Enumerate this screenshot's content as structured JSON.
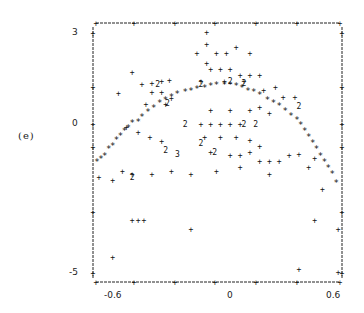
{
  "panel_label": "(e)",
  "axes": {
    "y_ticks": [
      "3",
      "0",
      "-5"
    ],
    "x_ticks": [
      "-0.6",
      "0",
      "0.6"
    ]
  },
  "chart_data": {
    "type": "scatter",
    "title": "",
    "panel": "(e)",
    "xlabel": "",
    "ylabel": "",
    "xlim": [
      -0.65,
      0.62
    ],
    "ylim": [
      -5.2,
      3.2
    ],
    "x_ticks": [
      -0.6,
      0,
      0.6
    ],
    "y_ticks": [
      -5,
      0,
      3
    ],
    "grid": false,
    "legend": null,
    "marker_note": "Line-printer style scatter: '+' single point, '*' dense/fitted points, '2'/'3' indicate overlapping point counts",
    "series": [
      {
        "name": "fitted-curve (*)",
        "marker": "*",
        "points": [
          [
            -0.63,
            -1.3
          ],
          [
            -0.61,
            -1.2
          ],
          [
            -0.59,
            -1.1
          ],
          [
            -0.57,
            -0.9
          ],
          [
            -0.55,
            -0.8
          ],
          [
            -0.53,
            -0.6
          ],
          [
            -0.51,
            -0.45
          ],
          [
            -0.49,
            -0.3
          ],
          [
            -0.47,
            -0.2
          ],
          [
            -0.45,
            -0.05
          ],
          [
            -0.42,
            0.0
          ],
          [
            -0.4,
            0.15
          ],
          [
            -0.37,
            0.3
          ],
          [
            -0.34,
            0.45
          ],
          [
            -0.31,
            0.6
          ],
          [
            -0.28,
            0.7
          ],
          [
            -0.25,
            0.8
          ],
          [
            -0.22,
            0.9
          ],
          [
            -0.18,
            0.95
          ],
          [
            -0.15,
            1.0
          ],
          [
            -0.12,
            1.05
          ],
          [
            -0.08,
            1.1
          ],
          [
            -0.05,
            1.15
          ],
          [
            -0.02,
            1.2
          ],
          [
            0.02,
            1.2
          ],
          [
            0.05,
            1.2
          ],
          [
            0.08,
            1.15
          ],
          [
            0.11,
            1.1
          ],
          [
            0.14,
            1.0
          ],
          [
            0.17,
            0.95
          ],
          [
            0.2,
            0.85
          ],
          [
            0.24,
            0.7
          ],
          [
            0.27,
            0.6
          ],
          [
            0.3,
            0.5
          ],
          [
            0.33,
            0.35
          ],
          [
            0.36,
            0.2
          ],
          [
            0.39,
            0.05
          ],
          [
            0.41,
            -0.1
          ],
          [
            0.43,
            -0.3
          ],
          [
            0.45,
            -0.5
          ],
          [
            0.47,
            -0.7
          ],
          [
            0.49,
            -0.9
          ],
          [
            0.51,
            -1.1
          ],
          [
            0.53,
            -1.3
          ],
          [
            0.55,
            -1.5
          ],
          [
            0.57,
            -1.7
          ],
          [
            0.59,
            -2.0
          ]
        ]
      },
      {
        "name": "observations (+)",
        "marker": "+",
        "points": [
          [
            -0.45,
            1.6
          ],
          [
            -0.52,
            0.9
          ],
          [
            -0.4,
            1.2
          ],
          [
            -0.35,
            1.25
          ],
          [
            -0.3,
            1.3
          ],
          [
            -0.26,
            1.35
          ],
          [
            -0.35,
            0.95
          ],
          [
            -0.3,
            0.95
          ],
          [
            -0.25,
            0.75
          ],
          [
            -0.38,
            0.55
          ],
          [
            -0.28,
            0.55
          ],
          [
            -0.48,
            -0.2
          ],
          [
            -0.42,
            -0.35
          ],
          [
            -0.36,
            -0.5
          ],
          [
            -0.3,
            -0.65
          ],
          [
            -0.5,
            -1.6
          ],
          [
            -0.45,
            -1.7
          ],
          [
            -0.35,
            -1.7
          ],
          [
            -0.25,
            -1.6
          ],
          [
            -0.15,
            -1.7
          ],
          [
            -0.55,
            -1.9
          ],
          [
            -0.62,
            -1.8
          ],
          [
            -0.45,
            -3.2
          ],
          [
            -0.42,
            -3.2
          ],
          [
            -0.39,
            -3.2
          ],
          [
            -0.55,
            -4.4
          ],
          [
            -0.15,
            -3.5
          ],
          [
            -0.07,
            2.9
          ],
          [
            -0.07,
            2.5
          ],
          [
            -0.12,
            2.2
          ],
          [
            -0.02,
            2.2
          ],
          [
            0.03,
            2.2
          ],
          [
            0.08,
            2.4
          ],
          [
            0.15,
            2.2
          ],
          [
            -0.07,
            1.9
          ],
          [
            -0.05,
            1.7
          ],
          [
            0.0,
            1.7
          ],
          [
            0.05,
            1.7
          ],
          [
            0.1,
            1.5
          ],
          [
            0.15,
            1.5
          ],
          [
            0.2,
            1.5
          ],
          [
            -0.1,
            1.3
          ],
          [
            0.02,
            1.3
          ],
          [
            0.12,
            1.3
          ],
          [
            0.22,
            1.0
          ],
          [
            0.28,
            1.1
          ],
          [
            0.32,
            0.8
          ],
          [
            0.38,
            0.8
          ],
          [
            -0.05,
            0.35
          ],
          [
            0.05,
            0.35
          ],
          [
            0.15,
            0.35
          ],
          [
            0.2,
            0.45
          ],
          [
            0.25,
            0.25
          ],
          [
            -0.1,
            -0.1
          ],
          [
            -0.05,
            -0.1
          ],
          [
            0.0,
            -0.1
          ],
          [
            0.05,
            -0.1
          ],
          [
            0.1,
            -0.1
          ],
          [
            -0.08,
            -0.5
          ],
          [
            0.0,
            -0.5
          ],
          [
            0.08,
            -0.5
          ],
          [
            0.15,
            -0.6
          ],
          [
            0.2,
            -0.8
          ],
          [
            -0.05,
            -1.0
          ],
          [
            0.05,
            -1.1
          ],
          [
            0.1,
            -1.1
          ],
          [
            0.15,
            -1.0
          ],
          [
            0.2,
            -1.3
          ],
          [
            0.25,
            -1.3
          ],
          [
            0.3,
            -1.3
          ],
          [
            0.35,
            -1.1
          ],
          [
            0.4,
            -1.05
          ],
          [
            -0.02,
            -1.6
          ],
          [
            0.1,
            -1.5
          ],
          [
            0.25,
            -1.7
          ],
          [
            0.45,
            -1.5
          ],
          [
            0.48,
            -1.2
          ],
          [
            0.52,
            -2.2
          ],
          [
            0.48,
            -3.2
          ],
          [
            0.6,
            -3.5
          ],
          [
            0.4,
            -4.8
          ],
          [
            0.6,
            -4.9
          ]
        ]
      },
      {
        "name": "overlap count 2",
        "marker": "2",
        "points": [
          [
            -0.32,
            1.2
          ],
          [
            -0.27,
            0.6
          ],
          [
            -0.1,
            1.2
          ],
          [
            0.05,
            1.3
          ],
          [
            0.12,
            1.25
          ],
          [
            0.4,
            0.5
          ],
          [
            -0.18,
            -0.1
          ],
          [
            0.12,
            -0.1
          ],
          [
            0.18,
            -0.1
          ],
          [
            -0.1,
            -0.7
          ],
          [
            -0.03,
            -1.0
          ],
          [
            -0.28,
            -0.95
          ],
          [
            -0.45,
            -1.8
          ]
        ]
      },
      {
        "name": "overlap count 3",
        "marker": "3",
        "points": [
          [
            -0.22,
            -1.05
          ]
        ]
      }
    ]
  }
}
